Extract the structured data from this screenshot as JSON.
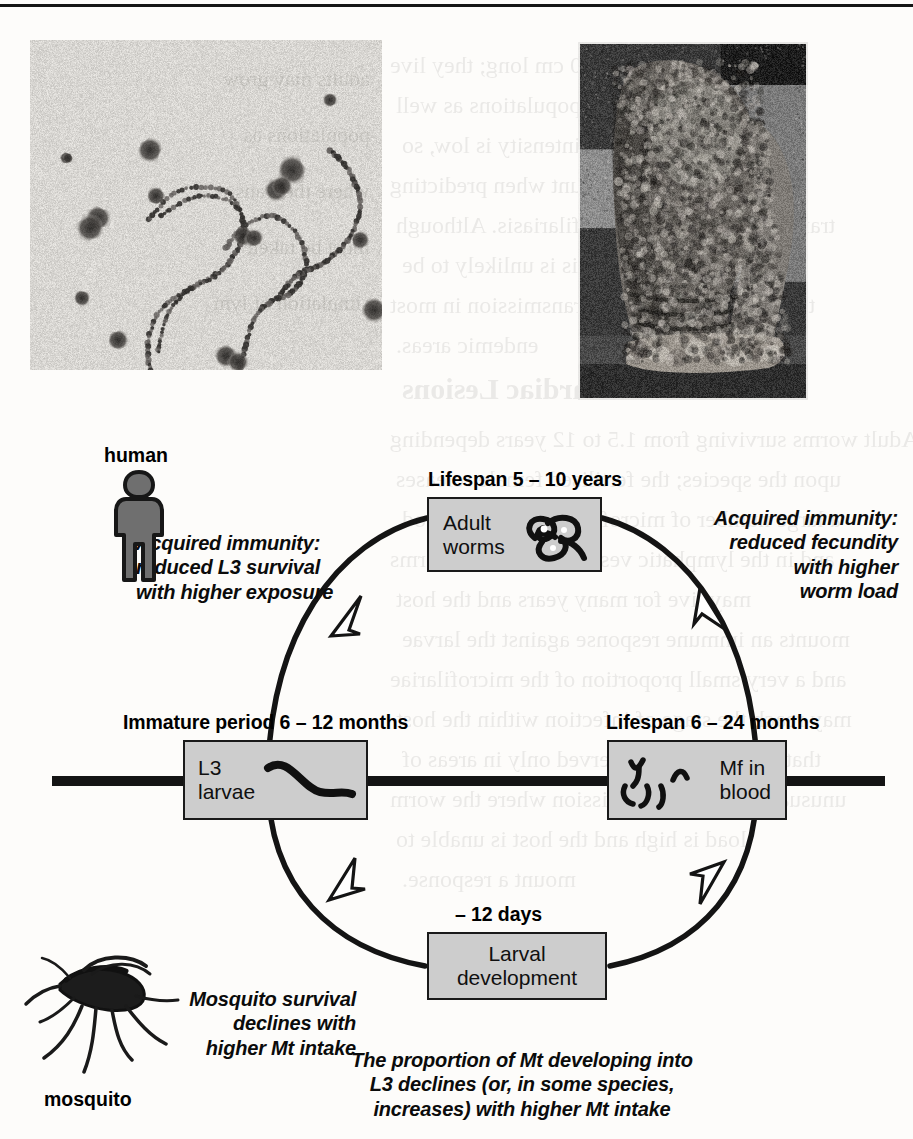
{
  "page": {
    "background_color": "#fdfcfa",
    "ink_color": "#101010",
    "box_fill_color": "#cdcdcd",
    "box_border_color": "#1a1a1a",
    "ghost_text_lines": [
      "Adults may grow to 50 cm long; they live",
      "and produce vector populations as well",
      "where the transmission intensity is low, so",
      "must be taken into account when predicting",
      "transmission of lymphatic filariasis. Although",
      "in the short term, this is unlikely to be",
      "the underlying force of transmission in most",
      "endemic areas.",
      "Filariasis and Cardiac Lesions",
      "Adult worms surviving from 1.5 to 12 years depending",
      "upon the species; the fertilised female releases",
      "a large number of microfilariae into the blood",
      "and in the lymphatic vessels. The adult worms",
      "may live for many years and the host",
      "mounts an immune response against the larvae",
      "and a very small proportion of the microfilariae",
      "may reach the stage of infection within the host",
      "that is likely to be observed only in areas of",
      "unusually intense transmission where the worm",
      "load is high and the host is unable to",
      "mount a response."
    ]
  },
  "photos": [
    {
      "name": "microfilariae-blood-smear",
      "caption_semantic": "blood smear showing microfilariae and blood cells",
      "x": 30,
      "y": 40,
      "width": 352,
      "height": 330
    },
    {
      "name": "elephantiasis-leg-photograph",
      "caption_semantic": "leg with advanced lymphoedema (elephantiasis)",
      "x": 578,
      "y": 42,
      "width": 230,
      "height": 358
    }
  ],
  "diagram": {
    "type": "life-cycle",
    "title_semantic": "Life cycle of lymphatic filariasis parasites",
    "organisms": [
      {
        "name": "human",
        "label": "human",
        "label_x": 104,
        "label_y": 44,
        "sprite_x": 106,
        "sprite_y": 68
      },
      {
        "name": "mosquito",
        "label": "mosquito",
        "label_x": 44,
        "label_y": 688,
        "sprite_x": 30,
        "sprite_y": 545
      }
    ],
    "nodes": [
      {
        "key": "adult_worms",
        "label": "Adult\nworms",
        "caption": "Lifespan 5 – 10 years",
        "icon": "adult-worm-coil-icon",
        "x": 427,
        "y": 97,
        "w": 175,
        "h": 75,
        "caption_x": 428,
        "caption_y": 68,
        "label_align": "left"
      },
      {
        "key": "l3_larvae",
        "label": "L3\nlarvae",
        "caption": "Immature period 6 – 12 months",
        "icon": "l3-larva-icon",
        "x": 183,
        "y": 340,
        "w": 185,
        "h": 80,
        "caption_x": 123,
        "caption_y": 311,
        "label_align": "left"
      },
      {
        "key": "mf_in_blood",
        "label": "Mf in\nblood",
        "caption": "Lifespan 6 – 24 months",
        "icon": "microfilaria-icon",
        "x": 607,
        "y": 340,
        "w": 180,
        "h": 80,
        "caption_x": 606,
        "caption_y": 311,
        "label_align": "right"
      },
      {
        "key": "larval_development",
        "label": "Larval\ndevelopment",
        "caption": "– 12 days",
        "icon": null,
        "x": 427,
        "y": 532,
        "w": 180,
        "h": 68,
        "caption_x": 455,
        "caption_y": 503,
        "label_align": "center"
      }
    ],
    "notes": [
      {
        "key": "acquired_immunity_l3",
        "text": "Acquired immunity:\nreduced L3 survival\nwith higher exposure",
        "x": 136,
        "y": 131,
        "w": 250,
        "align": "left"
      },
      {
        "key": "acquired_immunity_fecundity",
        "text": "Acquired immunity:\nreduced fecundity\nwith higher\nworm load",
        "x": 648,
        "y": 106,
        "w": 250,
        "align": "right"
      },
      {
        "key": "mosquito_survival",
        "text": "Mosquito survival\ndeclines with\nhigher Mt intake",
        "x": 128,
        "y": 587,
        "w": 228,
        "align": "right"
      },
      {
        "key": "mt_to_l3_proportion",
        "text": "The proportion of Mt developing into\nL3 declines (or, in some species,\nincreases) with higher Mt intake",
        "x": 327,
        "y": 648,
        "w": 390,
        "align": "center"
      }
    ],
    "arrows": [
      {
        "key": "human-to-adult-worms",
        "direction": "up-right",
        "at_x": 346,
        "at_y": 218
      },
      {
        "key": "adult-worms-to-mf",
        "direction": "down-right",
        "at_x": 713,
        "at_y": 206
      },
      {
        "key": "mf-to-larval-development",
        "direction": "down-left",
        "at_x": 710,
        "at_y": 480
      },
      {
        "key": "larval-development-to-l3",
        "direction": "up-left",
        "at_x": 344,
        "at_y": 478
      }
    ],
    "transmission_line": {
      "x1": 52,
      "x2": 885,
      "y": 381,
      "thickness": 10
    }
  }
}
